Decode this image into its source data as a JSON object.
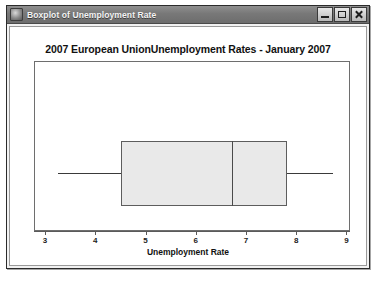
{
  "window": {
    "title": "Boxplot of Unemployment Rate",
    "icon": "app-icon",
    "controls": {
      "minimize_label": "Minimize",
      "maximize_label": "Maximize",
      "close_label": "Close"
    }
  },
  "chart_data": {
    "type": "boxplot",
    "title": "2007 European UnionUnemployment Rates - January 2007",
    "xlabel": "Unemployment Rate",
    "ylabel": "",
    "xlim": [
      2.78,
      9.07
    ],
    "ticks": [
      3,
      4,
      5,
      6,
      7,
      8,
      9
    ],
    "tick_labels": [
      "3",
      "4",
      "5",
      "6",
      "7",
      "8",
      "9"
    ],
    "grid": false,
    "legend": null,
    "orientation": "horizontal",
    "series": [
      {
        "name": "Unemployment Rate",
        "min": 3.24,
        "q1": 4.5,
        "median": 6.7,
        "q3": 7.8,
        "max": 8.72,
        "outliers": []
      }
    ],
    "colors": {
      "box_fill": "#e9e9e9",
      "box_border": "#5d5d5d",
      "whisker": "#3a3a3a",
      "median": "#4a4a4a",
      "axis": "#5a5a5a",
      "frame": "#6e6e6e"
    }
  }
}
